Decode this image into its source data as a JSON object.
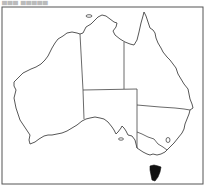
{
  "map": {
    "caption": "▄▄▄ ▄▄▄▄▄",
    "subject": "Australia",
    "highlighted_region": "Tasmania",
    "colors": {
      "frame": "#555555",
      "outline": "#444444",
      "highlight": "#111111",
      "background": "#ffffff"
    },
    "regions": [
      "Western Australia",
      "Northern Territory",
      "Queensland",
      "South Australia",
      "New South Wales",
      "Victoria",
      "Tasmania",
      "Australian Capital Territory"
    ]
  }
}
